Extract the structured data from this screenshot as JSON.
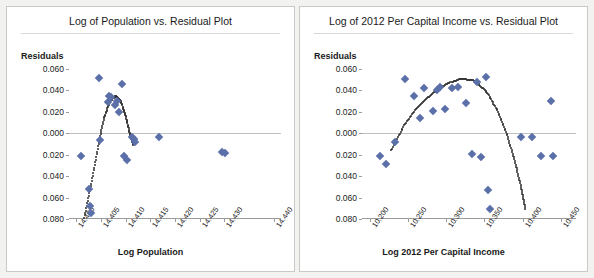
{
  "charts": [
    {
      "id": "population",
      "title": "Log of Population vs. Residual Plot",
      "ylabel": "Residuals",
      "xlabel": "Log Population",
      "ytick_labels": [
        "0.060",
        "0.040",
        "0.020",
        "0.000",
        "0.020",
        "0.040",
        "0.060",
        "0.080"
      ],
      "xtick_labels": [
        "14.400",
        "14.405",
        "14.410",
        "14.415",
        "14.420",
        "14.425",
        "14.430",
        "14.440"
      ],
      "point_color": "#5b6fa8",
      "fit_color": "#2b2b2b"
    },
    {
      "id": "income",
      "title": "Log of 2012 Per Capital Income vs. Residual Plot",
      "ylabel": "Residuals",
      "xlabel": "Log 2012 Per Capital Income",
      "ytick_labels": [
        "0.060",
        "0.040",
        "0.020",
        "0.000",
        "0.020",
        "0.040",
        "0.060",
        "0.080"
      ],
      "xtick_labels": [
        "10.200",
        "10.250",
        "10.300",
        "10.350",
        "10.400",
        "10.450"
      ],
      "point_color": "#5b6fa8",
      "fit_color": "#2b2b2b"
    }
  ],
  "chart_data": [
    {
      "type": "scatter",
      "title": "Log of Population vs. Residual Plot",
      "xlabel": "Log Population",
      "ylabel": "Residuals",
      "xlim": [
        14.3985,
        14.4415
      ],
      "ylim": [
        -0.08,
        0.06
      ],
      "ytick_values": [
        0.06,
        0.04,
        0.02,
        0.0,
        -0.02,
        -0.04,
        -0.06,
        -0.08
      ],
      "ytick_labels": [
        "0.060",
        "0.040",
        "0.020",
        "0.000",
        "0.020",
        "0.040",
        "0.060",
        "0.080"
      ],
      "xtick_values": [
        14.4,
        14.405,
        14.41,
        14.415,
        14.42,
        14.425,
        14.43,
        14.44
      ],
      "grid": false,
      "legend": "none",
      "points": [
        {
          "x": 14.4009,
          "y": -0.021
        },
        {
          "x": 14.4026,
          "y": -0.052
        },
        {
          "x": 14.4027,
          "y": -0.068
        },
        {
          "x": 14.403,
          "y": -0.074
        },
        {
          "x": 14.4046,
          "y": 0.052
        },
        {
          "x": 14.4047,
          "y": -0.006
        },
        {
          "x": 14.4064,
          "y": 0.029
        },
        {
          "x": 14.4066,
          "y": 0.035
        },
        {
          "x": 14.4071,
          "y": 0.034
        },
        {
          "x": 14.4078,
          "y": 0.026
        },
        {
          "x": 14.4083,
          "y": 0.03
        },
        {
          "x": 14.4086,
          "y": 0.02
        },
        {
          "x": 14.4092,
          "y": 0.046
        },
        {
          "x": 14.4096,
          "y": -0.021
        },
        {
          "x": 14.4102,
          "y": -0.025
        },
        {
          "x": 14.4113,
          "y": -0.003
        },
        {
          "x": 14.4116,
          "y": -0.005
        },
        {
          "x": 14.4118,
          "y": -0.008
        },
        {
          "x": 14.4167,
          "y": -0.003
        },
        {
          "x": 14.4296,
          "y": -0.017
        },
        {
          "x": 14.4302,
          "y": -0.018
        }
      ],
      "fit_curve": {
        "style": "dotted",
        "description": "inverted-U polynomial trend peaking near x=14.408",
        "points": [
          {
            "x": 14.4016,
            "y": -0.079
          },
          {
            "x": 14.403,
            "y": -0.047
          },
          {
            "x": 14.4044,
            "y": -0.012
          },
          {
            "x": 14.4056,
            "y": 0.014
          },
          {
            "x": 14.4068,
            "y": 0.03
          },
          {
            "x": 14.408,
            "y": 0.035
          },
          {
            "x": 14.409,
            "y": 0.03
          },
          {
            "x": 14.41,
            "y": 0.016
          },
          {
            "x": 14.4108,
            "y": 0.0
          },
          {
            "x": 14.4116,
            "y": -0.012
          }
        ]
      }
    },
    {
      "type": "scatter",
      "title": "Log of 2012 Per Capital Income vs. Residual Plot",
      "xlabel": "Log 2012 Per Capital Income",
      "ylabel": "Residuals",
      "xlim": [
        10.19,
        10.47
      ],
      "ylim": [
        -0.08,
        0.06
      ],
      "ytick_values": [
        0.06,
        0.04,
        0.02,
        0.0,
        -0.02,
        -0.04,
        -0.06,
        -0.08
      ],
      "ytick_labels": [
        "0.060",
        "0.040",
        "0.020",
        "0.000",
        "0.020",
        "0.040",
        "0.060",
        "0.080"
      ],
      "xtick_values": [
        10.2,
        10.25,
        10.3,
        10.35,
        10.4,
        10.45
      ],
      "grid": false,
      "legend": "none",
      "points": [
        {
          "x": 10.213,
          "y": -0.021
        },
        {
          "x": 10.222,
          "y": -0.029
        },
        {
          "x": 10.233,
          "y": -0.008
        },
        {
          "x": 10.246,
          "y": 0.051
        },
        {
          "x": 10.258,
          "y": 0.035
        },
        {
          "x": 10.266,
          "y": 0.014
        },
        {
          "x": 10.271,
          "y": 0.042
        },
        {
          "x": 10.283,
          "y": 0.021
        },
        {
          "x": 10.288,
          "y": 0.04
        },
        {
          "x": 10.292,
          "y": 0.043
        },
        {
          "x": 10.298,
          "y": 0.023
        },
        {
          "x": 10.308,
          "y": 0.042
        },
        {
          "x": 10.316,
          "y": 0.043
        },
        {
          "x": 10.326,
          "y": 0.028
        },
        {
          "x": 10.334,
          "y": -0.019
        },
        {
          "x": 10.341,
          "y": 0.048
        },
        {
          "x": 10.346,
          "y": -0.022
        },
        {
          "x": 10.352,
          "y": 0.053
        },
        {
          "x": 10.355,
          "y": -0.053
        },
        {
          "x": 10.357,
          "y": -0.071
        },
        {
          "x": 10.398,
          "y": -0.003
        },
        {
          "x": 10.412,
          "y": -0.003
        },
        {
          "x": 10.424,
          "y": -0.021
        },
        {
          "x": 10.437,
          "y": 0.03
        },
        {
          "x": 10.44,
          "y": -0.021
        }
      ],
      "fit_curve": {
        "style": "dotted",
        "description": "inverted-U polynomial trend peaking near x=10.330",
        "points": [
          {
            "x": 10.228,
            "y": -0.016
          },
          {
            "x": 10.244,
            "y": 0.006
          },
          {
            "x": 10.262,
            "y": 0.024
          },
          {
            "x": 10.28,
            "y": 0.036
          },
          {
            "x": 10.3,
            "y": 0.046
          },
          {
            "x": 10.32,
            "y": 0.051
          },
          {
            "x": 10.338,
            "y": 0.049
          },
          {
            "x": 10.354,
            "y": 0.038
          },
          {
            "x": 10.368,
            "y": 0.02
          },
          {
            "x": 10.38,
            "y": -0.002
          },
          {
            "x": 10.39,
            "y": -0.026
          },
          {
            "x": 10.398,
            "y": -0.05
          },
          {
            "x": 10.404,
            "y": -0.072
          }
        ]
      }
    }
  ]
}
